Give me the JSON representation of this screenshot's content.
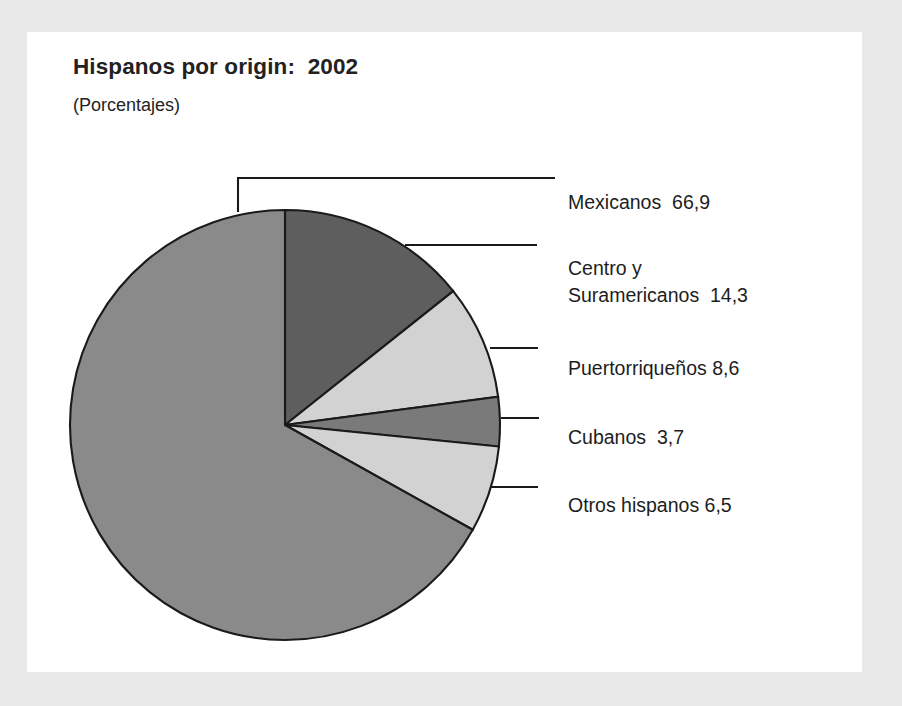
{
  "page": {
    "background_color": "#e9e9e9",
    "card_color": "#ffffff"
  },
  "header": {
    "title": "Hispanos por origin:  2002",
    "subtitle": "(Porcentajes)"
  },
  "labels": {
    "mexicanos": "Mexicanos  66,9",
    "centro_line1": "Centro y",
    "centro_line2": "Suramericanos  14,3",
    "puertorriquenos": "Puertorriqueños 8,6",
    "cubanos": "Cubanos  3,7",
    "otros": "Otros hispanos 6,5"
  },
  "chart_data": {
    "type": "pie",
    "title": "Hispanos por origin:  2002",
    "subtitle": "(Porcentajes)",
    "unit": "percent",
    "start_angle_deg": 0,
    "direction": "clockwise",
    "categories": [
      "Mexicanos",
      "Centro y Suramericanos",
      "Puertorriqueños",
      "Cubanos",
      "Otros hispanos"
    ],
    "values": [
      66.9,
      14.3,
      8.6,
      3.7,
      6.5
    ],
    "value_labels": [
      "66,9",
      "14,3",
      "8,6",
      "3,7",
      "6,5"
    ],
    "colors": [
      "#8a8a8a",
      "#5e5e5e",
      "#d2d2d2",
      "#7a7a7a",
      "#d2d2d2"
    ],
    "slice_outline_color": "#1a1a1a",
    "legend": "callouts-right",
    "slices": [
      {
        "name": "Mexicanos",
        "value": 66.9,
        "label": "Mexicanos  66,9",
        "color": "#8a8a8a"
      },
      {
        "name": "Centro y Suramericanos",
        "value": 14.3,
        "label": "Centro y Suramericanos  14,3",
        "color": "#5e5e5e"
      },
      {
        "name": "Puertorriqueños",
        "value": 8.6,
        "label": "Puertorriqueños 8,6",
        "color": "#d2d2d2"
      },
      {
        "name": "Cubanos",
        "value": 3.7,
        "label": "Cubanos  3,7",
        "color": "#7a7a7a"
      },
      {
        "name": "Otros hispanos",
        "value": 6.5,
        "label": "Otros hispanos 6,5",
        "color": "#d2d2d2"
      }
    ]
  }
}
